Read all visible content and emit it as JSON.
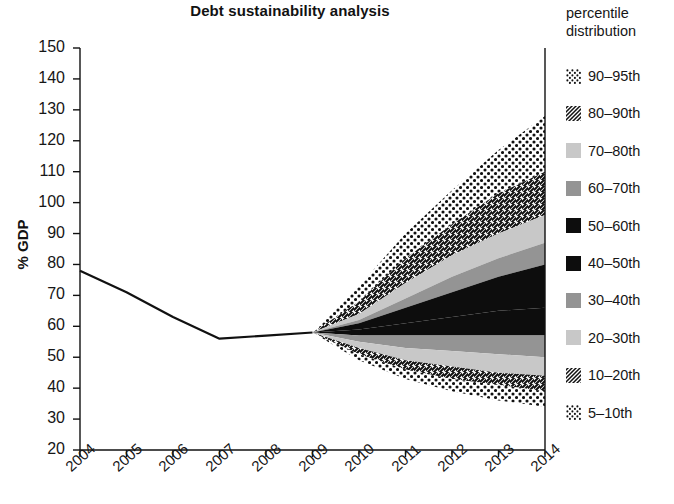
{
  "chart_data": {
    "type": "area",
    "title": "Debt sustainability analysis",
    "xlabel": "",
    "ylabel": "% GDP",
    "xlim": [
      2004,
      2014
    ],
    "ylim": [
      20,
      150
    ],
    "ytick_step": 10,
    "grid": false,
    "legend_position": "right",
    "legend_title_line1": "percentile",
    "legend_title_line2": "distribution",
    "categories": [
      "2004",
      "2005",
      "2006",
      "2007",
      "2008",
      "2009",
      "2010",
      "2011",
      "2012",
      "2013",
      "2014"
    ],
    "yticks": [
      150,
      140,
      130,
      120,
      110,
      100,
      90,
      80,
      70,
      60,
      50,
      40,
      30,
      20
    ],
    "history": {
      "name": "historical debt",
      "x": [
        2004,
        2005,
        2006,
        2007,
        2008,
        2009
      ],
      "values": [
        78,
        71,
        63,
        56,
        57,
        58
      ]
    },
    "fan_origin": {
      "year": 2009,
      "value": 58
    },
    "series": [
      {
        "name": "90-95th",
        "texture": "dots",
        "color": "#ffffff",
        "upper": [
          58,
          73,
          90,
          104,
          117,
          128
        ],
        "lower": [
          58,
          68,
          82,
          93,
          103,
          110
        ],
        "x": [
          2009,
          2010,
          2011,
          2012,
          2013,
          2014
        ]
      },
      {
        "name": "80-90th",
        "texture": "hatch",
        "color": "#ffffff",
        "upper": [
          58,
          68,
          82,
          93,
          103,
          110
        ],
        "lower": [
          58,
          64,
          74,
          83,
          90,
          96
        ],
        "x": [
          2009,
          2010,
          2011,
          2012,
          2013,
          2014
        ]
      },
      {
        "name": "70-80th",
        "texture": "solid",
        "color": "#c8c8c8",
        "upper": [
          58,
          64,
          74,
          83,
          90,
          96
        ],
        "lower": [
          58,
          62,
          69,
          76,
          82,
          87
        ],
        "x": [
          2009,
          2010,
          2011,
          2012,
          2013,
          2014
        ]
      },
      {
        "name": "60-70th",
        "texture": "solid",
        "color": "#949494",
        "upper": [
          58,
          62,
          69,
          76,
          82,
          87
        ],
        "lower": [
          58,
          61,
          66,
          71,
          76,
          80
        ],
        "x": [
          2009,
          2010,
          2011,
          2012,
          2013,
          2014
        ]
      },
      {
        "name": "50-60th",
        "texture": "solid",
        "color": "#0d0d0d",
        "upper": [
          58,
          61,
          66,
          71,
          76,
          80
        ],
        "lower": [
          58,
          59,
          61,
          63,
          65,
          66
        ],
        "x": [
          2009,
          2010,
          2011,
          2012,
          2013,
          2014
        ]
      },
      {
        "name": "40-50th",
        "texture": "solid",
        "color": "#0d0d0d",
        "upper": [
          58,
          59,
          61,
          63,
          65,
          66
        ],
        "lower": [
          58,
          57,
          57,
          57,
          57,
          57
        ],
        "x": [
          2009,
          2010,
          2011,
          2012,
          2013,
          2014
        ]
      },
      {
        "name": "30-40th",
        "texture": "solid",
        "color": "#949494",
        "upper": [
          58,
          57,
          57,
          57,
          57,
          57
        ],
        "lower": [
          58,
          55,
          53,
          52,
          51,
          50
        ],
        "x": [
          2009,
          2010,
          2011,
          2012,
          2013,
          2014
        ]
      },
      {
        "name": "20-30th",
        "texture": "solid",
        "color": "#c8c8c8",
        "upper": [
          58,
          55,
          53,
          52,
          51,
          50
        ],
        "lower": [
          58,
          53,
          49,
          47,
          45,
          44
        ],
        "x": [
          2009,
          2010,
          2011,
          2012,
          2013,
          2014
        ]
      },
      {
        "name": "10-20th",
        "texture": "hatch",
        "color": "#ffffff",
        "upper": [
          58,
          53,
          49,
          47,
          45,
          44
        ],
        "lower": [
          58,
          51,
          46,
          43,
          41,
          39
        ],
        "x": [
          2009,
          2010,
          2011,
          2012,
          2013,
          2014
        ]
      },
      {
        "name": "5-10th",
        "texture": "dots",
        "color": "#ffffff",
        "upper": [
          58,
          51,
          46,
          43,
          41,
          39
        ],
        "lower": [
          58,
          49,
          43,
          39,
          36,
          34
        ],
        "x": [
          2009,
          2010,
          2011,
          2012,
          2013,
          2014
        ]
      }
    ],
    "legend": [
      {
        "label": "90–95th",
        "texture": "dots"
      },
      {
        "label": "80–90th",
        "texture": "hatch"
      },
      {
        "label": "70–80th",
        "texture": "solid",
        "color": "#c8c8c8"
      },
      {
        "label": "60–70th",
        "texture": "solid",
        "color": "#949494"
      },
      {
        "label": "50–60th",
        "texture": "solid",
        "color": "#0d0d0d"
      },
      {
        "label": "40–50th",
        "texture": "solid",
        "color": "#0d0d0d"
      },
      {
        "label": "30–40th",
        "texture": "solid",
        "color": "#949494"
      },
      {
        "label": "20–30th",
        "texture": "solid",
        "color": "#c8c8c8"
      },
      {
        "label": "10–20th",
        "texture": "hatch"
      },
      {
        "label": "5–10th",
        "texture": "dots"
      }
    ]
  }
}
